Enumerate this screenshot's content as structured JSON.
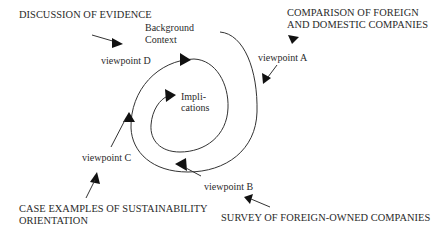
{
  "diagram": {
    "type": "spiral-research-model",
    "center": {
      "line1": "Impli-",
      "line2": "cations"
    },
    "start": {
      "line1": "Background",
      "line2": "Context"
    },
    "viewpoints": [
      {
        "id": "A",
        "label": "viewpoint A",
        "source": [
          "COMPARISON OF FOREIGN",
          "AND DOMESTIC COMPANIES"
        ]
      },
      {
        "id": "B",
        "label": "viewpoint B",
        "source": [
          "SURVEY OF FOREIGN-OWNED COMPANIES"
        ]
      },
      {
        "id": "C",
        "label": "viewpoint C",
        "source": [
          "CASE EXAMPLES OF SUSTAINABILITY",
          "ORIENTATION"
        ]
      },
      {
        "id": "D",
        "label": "viewpoint D",
        "source": [
          "DISCUSSION OF EVIDENCE"
        ]
      }
    ],
    "colors": {
      "line": "#333333",
      "arrowhead": "#111111",
      "text": "#2a2a2a",
      "background": "#ffffff"
    }
  }
}
